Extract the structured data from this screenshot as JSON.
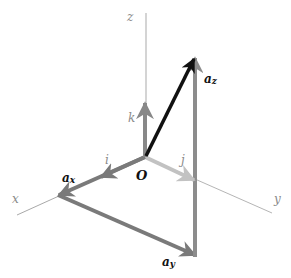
{
  "diagram": {
    "origin": {
      "label": "O",
      "x": 145,
      "y": 157
    },
    "axes": [
      {
        "id": "x",
        "label": "x",
        "x2": 17,
        "y2": 215,
        "label_x": 12,
        "label_y": 203
      },
      {
        "id": "y",
        "label": "y",
        "x2": 272,
        "y2": 213,
        "label_x": 274,
        "label_y": 203
      },
      {
        "id": "z",
        "label": "z",
        "x2": 146,
        "y2": 13,
        "label_x": 127,
        "label_y": 21
      }
    ],
    "unit_vectors": [
      {
        "id": "i",
        "label": "i",
        "x2": 100,
        "y2": 177,
        "color": "#7a7a7a",
        "label_x": 105,
        "label_y": 164
      },
      {
        "id": "j",
        "label": "j",
        "x2": 195,
        "y2": 180,
        "color": "#c2c2c2",
        "label_x": 181,
        "label_y": 164
      },
      {
        "id": "k",
        "label": "k",
        "x2": 145,
        "y2": 103,
        "color": "#888888",
        "label_x": 128,
        "label_y": 122
      }
    ],
    "vectors": [
      {
        "id": "a",
        "label": "a",
        "x1": 145,
        "y1": 157,
        "x2": 195,
        "y2": 57,
        "color": "#111111",
        "label_x": 168,
        "label_y": 74
      },
      {
        "id": "ax",
        "label": "aₓ",
        "label_base": "a",
        "label_sub": "x",
        "x1": 145,
        "y1": 157,
        "x2": 58,
        "y2": 195,
        "color": "#7a7a7a",
        "label_x": 62,
        "label_y": 182
      },
      {
        "id": "ay",
        "label": "ay",
        "label_base": "a",
        "label_sub": "y",
        "x1": 58,
        "y1": 195,
        "x2": 195,
        "y2": 255,
        "color": "#7a7a7a",
        "label_x": 162,
        "label_y": 266
      },
      {
        "id": "az",
        "label": "az",
        "label_base": "a",
        "label_sub": "z",
        "x1": 195,
        "y1": 255,
        "x2": 195,
        "y2": 57,
        "color": "#8c8c8c",
        "label_x": 204,
        "label_y": 83
      }
    ],
    "colors": {
      "axis_line": "#a9a9a9",
      "vector_a": "#111111",
      "component": "#7a7a7a",
      "unit_k": "#888888",
      "unit_j": "#c2c2c2"
    }
  }
}
